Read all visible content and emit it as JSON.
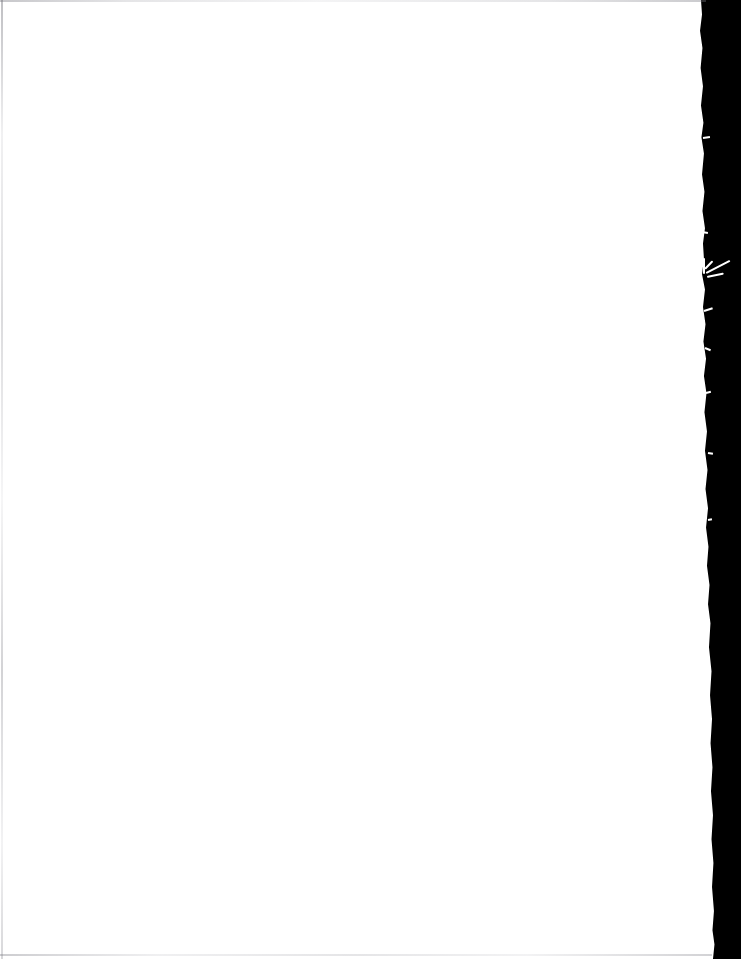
{
  "document": {
    "kind": "scanned-page-image",
    "page_content_text": "",
    "page_note": "blank page",
    "background_color": "#000000",
    "paper_color": "#ffffff",
    "edge_hairline_color": "#c9c9cf",
    "fiber_color": "#ffffff"
  },
  "scan": {
    "width_px": 741,
    "height_px": 959,
    "paper_right_edge_px": 706,
    "backdrop_left_edge_px": 700
  },
  "regions": {
    "paper_label": "",
    "backdrop_label": "",
    "torn_edge_label": "",
    "fiber_label": ""
  }
}
